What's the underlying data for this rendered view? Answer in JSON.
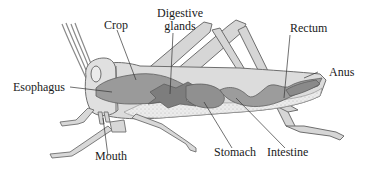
{
  "diagram": {
    "labels": {
      "crop": "Crop",
      "digestive_glands_line1": "Digestive",
      "digestive_glands_line2": "glands",
      "rectum": "Rectum",
      "anus": "Anus",
      "esophagus": "Esophagus",
      "mouth": "Mouth",
      "stomach": "Stomach",
      "intestine": "Intestine"
    },
    "colors": {
      "outline": "#6e6e6e",
      "body_fill": "#dcdcdc",
      "abdomen_stipple": "#e6e6e6",
      "gut_fill": "#9a9a9a",
      "gut_dark": "#7d7d7d",
      "leader_line": "#333333",
      "text": "#1a1a1a"
    }
  }
}
